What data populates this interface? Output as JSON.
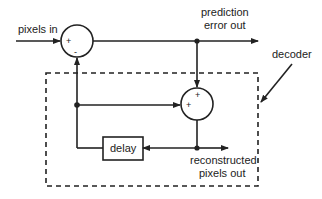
{
  "diagram": {
    "labels": {
      "input": "pixels in",
      "prediction_error_line1": "prediction",
      "prediction_error_line2": "error out",
      "decoder": "decoder",
      "delay": "delay",
      "reconstructed_line1": "reconstructed",
      "reconstructed_line2": "pixels out"
    },
    "summer1": {
      "plus": "+",
      "minus": "-"
    },
    "summer2": {
      "plus_top": "+",
      "plus_left": "+"
    },
    "colors": {
      "stroke": "#222222",
      "background": "#ffffff"
    }
  }
}
